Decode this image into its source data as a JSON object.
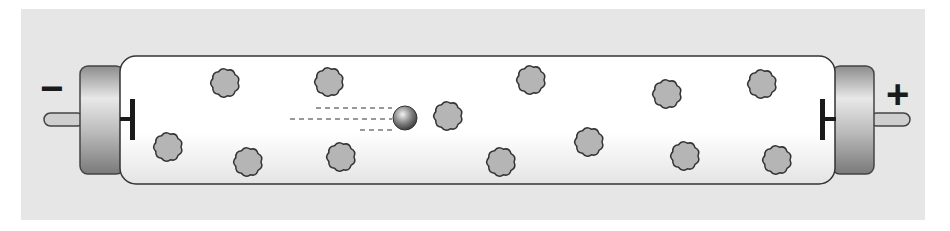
{
  "diagram": {
    "colors": {
      "background": "#e6e6e6",
      "tube_fill": "#ffffff",
      "outline": "#333333",
      "gas_atom": "#b5b5b5",
      "electrode": "#1a1a1a"
    },
    "labels": {
      "negative_terminal": "−",
      "positive_terminal": "+"
    },
    "electron": {
      "x": 405,
      "y": 118,
      "r": 12
    },
    "gas_atoms": [
      {
        "x": 225,
        "y": 83
      },
      {
        "x": 329,
        "y": 82
      },
      {
        "x": 168,
        "y": 147
      },
      {
        "x": 248,
        "y": 162
      },
      {
        "x": 341,
        "y": 157
      },
      {
        "x": 448,
        "y": 116
      },
      {
        "x": 531,
        "y": 80
      },
      {
        "x": 501,
        "y": 162
      },
      {
        "x": 589,
        "y": 142
      },
      {
        "x": 667,
        "y": 94
      },
      {
        "x": 685,
        "y": 156
      },
      {
        "x": 762,
        "y": 84
      },
      {
        "x": 777,
        "y": 160
      }
    ]
  }
}
